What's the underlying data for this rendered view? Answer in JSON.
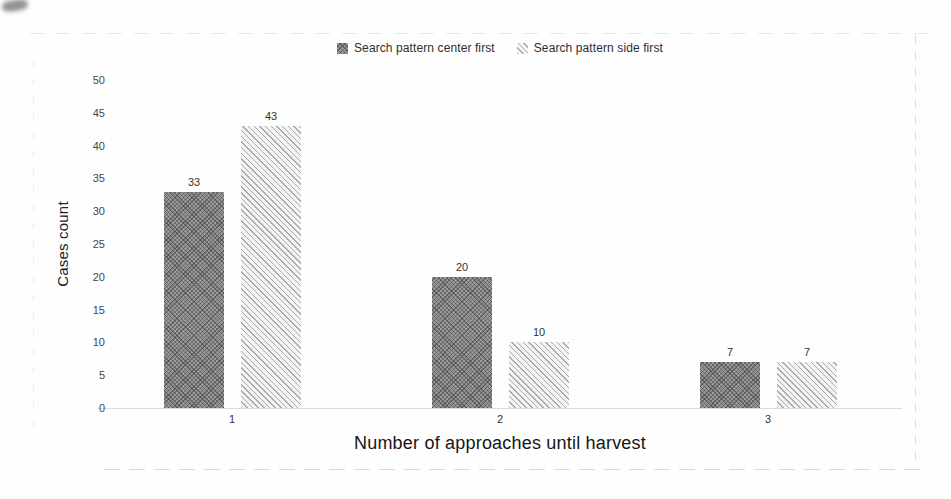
{
  "chart_data": {
    "type": "bar",
    "categories": [
      "1",
      "2",
      "3"
    ],
    "series": [
      {
        "name": "Search pattern center first",
        "values": [
          33,
          20,
          7
        ]
      },
      {
        "name": "Search pattern side first",
        "values": [
          43,
          10,
          7
        ]
      }
    ],
    "title": "",
    "xlabel": "Number of approaches until harvest",
    "ylabel": "Cases count",
    "ylim": [
      0,
      50
    ],
    "yticks": [
      0,
      5,
      10,
      15,
      20,
      25,
      30,
      35,
      40,
      45,
      50
    ],
    "grid": false,
    "legend_position": "top",
    "bar_labels_shown": true
  },
  "style": {
    "dark_bar_color": "#8f8f8f",
    "light_bar_color": "#e8e8e8",
    "axis_line_color": "#dcdcdc",
    "text_color": "#3a3a3a",
    "background_color": "#fefefe"
  }
}
